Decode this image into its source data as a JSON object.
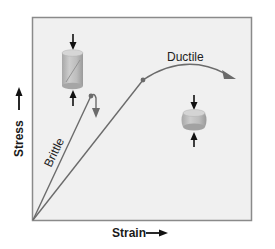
{
  "diagram": {
    "type": "stress-strain diagram",
    "axes": {
      "x_label": "Strain",
      "y_label": "Stress",
      "x_arrow": "right-arrow",
      "y_arrow": "up-arrow"
    },
    "curves": [
      {
        "name": "Brittle",
        "label": "Brittle",
        "description": "Steep linear rise to a failure point, then a short hook downward with arrow",
        "color": "#6b6b6b"
      },
      {
        "name": "Ductile",
        "label": "Ductile",
        "description": "Shallower linear rise to a yield point, then a long arching curve ending in an arrow",
        "color": "#6b6b6b"
      }
    ],
    "specimens": [
      {
        "name": "brittle-specimen",
        "shape": "tall cylinder with diagonal fracture line",
        "forces": "compressive arrows top and bottom"
      },
      {
        "name": "ductile-specimen",
        "shape": "short bulged cylinder",
        "forces": "compressive arrows top and bottom"
      }
    ],
    "colors": {
      "plot_background": "#f0f0f0",
      "frame": "#8a8a8a",
      "curve": "#6b6b6b",
      "specimen_fill": "#b9b9b9",
      "arrow": "#111111"
    }
  }
}
